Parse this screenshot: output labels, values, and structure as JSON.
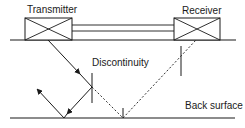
{
  "diagram": {
    "title": "",
    "labels": {
      "transmitter": "Transmitter",
      "receiver": "Receiver",
      "discontinuity": "Discontinuity",
      "back_surface": "Back surface"
    },
    "colors": {
      "stroke": "#1a1a1a",
      "background": "#ffffff"
    },
    "elements": {
      "top_surface": {
        "x1": 10,
        "y1": 40,
        "x2": 236,
        "y2": 40
      },
      "back_surface": {
        "x1": 10,
        "y1": 118,
        "x2": 235,
        "y2": 118
      },
      "transmitter_box": {
        "x": 25,
        "y": 18,
        "w": 47,
        "h": 22
      },
      "receiver_box": {
        "x": 174,
        "y": 18,
        "w": 46,
        "h": 22
      },
      "connecting_bar": {
        "x1": 72,
        "x2": 174,
        "y_top": 25,
        "y_bottom": 31
      },
      "incident_ray": {
        "from": [
          48,
          40
        ],
        "to": [
          92,
          87
        ],
        "style": "solid",
        "arrow_at": [
          80,
          74
        ]
      },
      "reflected_ray_down": {
        "from": [
          92,
          87
        ],
        "to": [
          64,
          118
        ],
        "style": "solid",
        "arrow_at": [
          68,
          113
        ]
      },
      "reflected_ray_up": {
        "from": [
          64,
          118
        ],
        "to": [
          37,
          89
        ],
        "style": "solid",
        "arrow_at": [
          37,
          89
        ]
      },
      "transmitted_ray_dashed": {
        "from": [
          92,
          87
        ],
        "to": [
          123,
          118
        ],
        "style": "dashed"
      },
      "returned_ray_dashed": {
        "from": [
          123,
          118
        ],
        "to": [
          196,
          40
        ],
        "style": "dashed"
      },
      "discontinuity_marker": {
        "x": 92,
        "y1": 73,
        "y2": 103
      },
      "back_surface_tick": {
        "x": 123,
        "y1": 108,
        "y2": 118
      },
      "receiver_side_marker": {
        "x": 181,
        "y1": 46,
        "y2": 76
      }
    }
  }
}
